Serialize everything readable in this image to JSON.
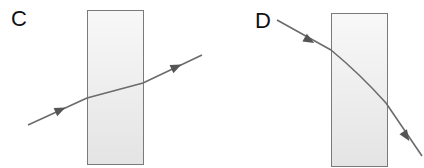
{
  "diagrams": [
    {
      "id": "C",
      "label": "C",
      "description": "Light ray passes through a glass block, bending toward the normal inside and emerging parallel to incident direction",
      "block": {
        "x": 87,
        "y": 10,
        "width": 56,
        "height": 154,
        "fill_top": "#f7f7f7",
        "fill_bottom": "#e6e6e6",
        "stroke": "#7a7a7a"
      },
      "ray": {
        "points": [
          [
            28,
            125
          ],
          [
            87,
            98
          ],
          [
            143,
            83
          ],
          [
            202,
            55
          ]
        ],
        "arrows": [
          [
            59,
            110,
            24
          ],
          [
            176,
            67,
            -25
          ]
        ],
        "color": "#6b6b6b"
      }
    },
    {
      "id": "D",
      "label": "D",
      "description": "Light ray enters glass block and bends away, curving downward and exiting steeply",
      "block": {
        "x": 119,
        "y": 13,
        "width": 56,
        "height": 153,
        "fill_top": "#f7f7f7",
        "fill_bottom": "#e6e6e6",
        "stroke": "#7a7a7a"
      },
      "ray": {
        "points": [
          [
            65,
            20
          ],
          [
            119,
            50
          ],
          [
            174,
            103
          ],
          [
            210,
            156
          ]
        ],
        "arrows": [
          [
            97,
            40,
            29
          ],
          [
            193,
            135,
            56
          ]
        ],
        "color": "#6b6b6b"
      }
    }
  ],
  "colors": {
    "background": "#ffffff",
    "label_text": "#111111",
    "ray": "#6b6b6b",
    "block_stroke": "#7a7a7a"
  }
}
